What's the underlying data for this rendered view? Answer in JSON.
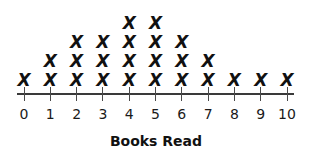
{
  "chart_data": {
    "type": "dot_plot",
    "title": "",
    "xlabel": "Books Read",
    "ylabel": "",
    "categories": [
      "0",
      "1",
      "2",
      "3",
      "4",
      "5",
      "6",
      "7",
      "8",
      "9",
      "10"
    ],
    "values": [
      1,
      2,
      3,
      3,
      4,
      4,
      3,
      2,
      1,
      1,
      1
    ],
    "marker": "X",
    "marker_color": "#111111",
    "axis_color": "#3a3a3a",
    "background": "#ffffff",
    "grid": false,
    "legend": false,
    "xlim": [
      0,
      10
    ],
    "total_count": 25
  },
  "axis": {
    "title": "Books Read",
    "tick_labels": [
      "0",
      "1",
      "2",
      "3",
      "4",
      "5",
      "6",
      "7",
      "8",
      "9",
      "10"
    ]
  },
  "marks": {
    "glyph": "X"
  }
}
